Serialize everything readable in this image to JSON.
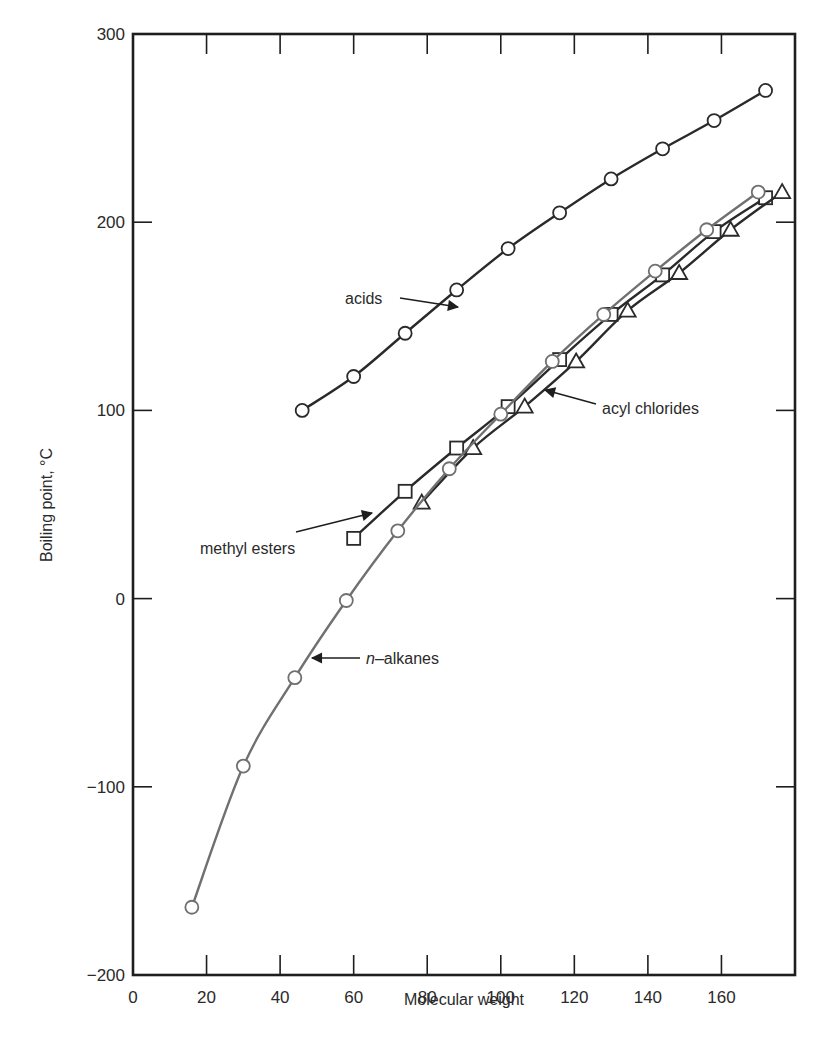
{
  "chart_data": {
    "type": "line",
    "title": "",
    "xlabel": "Molecular weight",
    "ylabel": "Boiling point, °C",
    "xlim": [
      0,
      180
    ],
    "ylim": [
      -200,
      300
    ],
    "grid": false,
    "legend_position": "inline annotations",
    "x_ticks": [
      0,
      20,
      40,
      60,
      80,
      100,
      120,
      140,
      160
    ],
    "x_tick_labels": [
      "0",
      "20",
      "40",
      "60",
      "80",
      "100",
      "120",
      "140",
      "160"
    ],
    "y_ticks": [
      -200,
      -100,
      0,
      100,
      200,
      300
    ],
    "y_tick_labels": [
      "−200",
      "−100",
      "0",
      "100",
      "200",
      "300"
    ],
    "series": [
      {
        "name": "acids",
        "marker": "circle",
        "color": "#2a2a2a",
        "x": [
          46,
          60,
          74,
          88,
          102,
          116,
          130,
          144,
          158,
          172
        ],
        "y": [
          100,
          118,
          141,
          164,
          186,
          205,
          223,
          239,
          254,
          270
        ]
      },
      {
        "name": "methyl esters",
        "marker": "square",
        "color": "#2a2a2a",
        "x": [
          60,
          74,
          88,
          102,
          116,
          130,
          144,
          158,
          172
        ],
        "y": [
          32,
          57,
          80,
          102,
          127,
          151,
          172,
          195,
          213
        ]
      },
      {
        "name": "acyl chlorides",
        "marker": "triangle",
        "color": "#2a2a2a",
        "x": [
          78.5,
          92.5,
          106.5,
          120.5,
          134.5,
          148.5,
          162.5,
          176.5
        ],
        "y": [
          51,
          80,
          102,
          126,
          153,
          173,
          196,
          216
        ]
      },
      {
        "name": "n-alkanes",
        "marker": "circle",
        "color": "#707070",
        "x": [
          16,
          30,
          44,
          58,
          72,
          86,
          100,
          114,
          128,
          142,
          156,
          170
        ],
        "y": [
          -164,
          -89,
          -42,
          -1,
          36,
          69,
          98,
          126,
          151,
          174,
          196,
          216
        ]
      }
    ],
    "annotations": [
      {
        "text": "acids",
        "italic_prefix": "",
        "label_x": 345,
        "label_y": 304,
        "arrow": [
          400,
          298,
          458,
          307
        ]
      },
      {
        "text": "methyl esters",
        "italic_prefix": "",
        "label_x": 200,
        "label_y": 554,
        "arrow": [
          296,
          532,
          372,
          513
        ]
      },
      {
        "text": "acyl chlorides",
        "italic_prefix": "",
        "label_x": 602,
        "label_y": 414,
        "arrow": [
          596,
          404,
          545,
          390
        ]
      },
      {
        "text": "–alkanes",
        "italic_prefix": "n",
        "label_x": 366,
        "label_y": 664,
        "arrow": [
          360,
          658,
          312,
          658
        ]
      }
    ]
  }
}
